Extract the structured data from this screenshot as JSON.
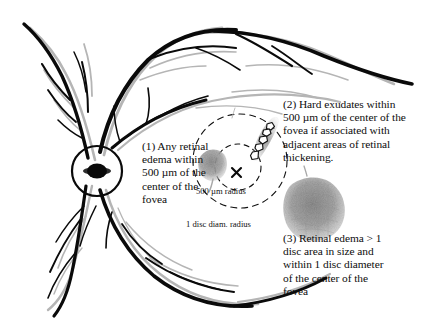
{
  "figure": {
    "background_color": "#ffffff",
    "vein_color": "#0a0a0a",
    "artery_color": "#b5b5b5",
    "edema_color": "#9a9a9a",
    "exudate_outline_color": "#111111"
  },
  "callouts": [
    {
      "id": "callout-1",
      "number": "(1)",
      "text": "(1) Any retinal\nedema within\n500 µm of the\ncenter of the\nfovea"
    },
    {
      "id": "callout-2",
      "number": "(2)",
      "text": "(2) Hard exudates within\n500 µm of the center of the\nfovea if associated with\nadjacent areas of retinal\nthickening."
    },
    {
      "id": "callout-3",
      "number": "(3)",
      "text": "(3) Retinal edema > 1\ndisc area in size and\nwithin 1 disc diameter\nof the center of the\nfovea"
    }
  ],
  "annotations": {
    "inner_circle_label": "500 µm radius",
    "outer_circle_label": "1 disc diam. radius",
    "fovea_marker": "×"
  },
  "landmarks": {
    "optic_disc": "optic-disc",
    "fovea_center": "fovea-center-marker",
    "inner_radius_circle": "500-micron-radius-circle",
    "outer_radius_circle": "one-disc-diameter-radius-circle",
    "small_edema_blob": "retinal-edema-near-fovea",
    "large_edema_blob": "large-retinal-edema-area",
    "hard_exudate_cluster": "hard-exudate-cluster"
  }
}
